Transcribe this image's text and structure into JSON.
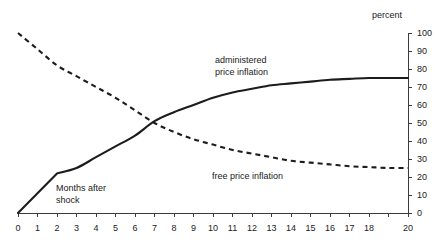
{
  "chart_data": {
    "type": "line",
    "title": "",
    "subtitle": "",
    "xlabel": "Months after shock",
    "ylabel": "percent",
    "xlim": [
      0,
      20
    ],
    "ylim": [
      0,
      100
    ],
    "grid": false,
    "legend_position": "inline-annotations",
    "y_axis_side": "right",
    "x_ticks": [
      0,
      1,
      2,
      3,
      4,
      5,
      6,
      7,
      8,
      9,
      10,
      11,
      12,
      13,
      14,
      15,
      16,
      17,
      18,
      19,
      20
    ],
    "x_tick_labels": [
      "0",
      "1",
      "2",
      "3",
      "4",
      "5",
      "6",
      "7",
      "8",
      "9",
      "10",
      "11",
      "12",
      "13",
      "14",
      "15",
      "16",
      "17",
      "18",
      "",
      "20"
    ],
    "y_ticks": [
      0,
      10,
      20,
      30,
      40,
      50,
      60,
      70,
      80,
      90,
      100
    ],
    "y_tick_labels": [
      "0",
      "10",
      "20",
      "30",
      "40",
      "50",
      "60",
      "70",
      "80",
      "90",
      "100"
    ],
    "x": [
      0,
      1,
      2,
      3,
      4,
      5,
      6,
      7,
      8,
      9,
      10,
      11,
      12,
      13,
      14,
      15,
      16,
      17,
      18,
      19,
      20
    ],
    "series": [
      {
        "name": "administered price inflation",
        "style": "solid",
        "color": "#1c1c1c",
        "values": [
          0,
          11,
          22,
          25,
          31,
          37,
          43,
          51,
          56,
          60,
          64,
          67,
          69,
          71,
          72,
          73,
          74,
          74.5,
          75,
          75,
          75
        ]
      },
      {
        "name": "free price inflation",
        "style": "dashed",
        "color": "#1c1c1c",
        "values": [
          100,
          91,
          82,
          76,
          70,
          64,
          57,
          50,
          45,
          41,
          38,
          35,
          33,
          31,
          29,
          28,
          27,
          26,
          25.5,
          25,
          25
        ]
      }
    ],
    "annotations": [
      {
        "name": "administered-price-inflation-label",
        "text_line1": "administered",
        "text_line2": "price inflation",
        "x": 10.0,
        "y": 82
      },
      {
        "name": "free-price-inflation-label",
        "text": "free price inflation",
        "x": 10.0,
        "y": 30
      },
      {
        "name": "months-after-shock-label",
        "text_line1": "Months after",
        "text_line2": "shock",
        "x": 2.2,
        "y": 17
      }
    ],
    "axis_unit_label": "percent"
  }
}
